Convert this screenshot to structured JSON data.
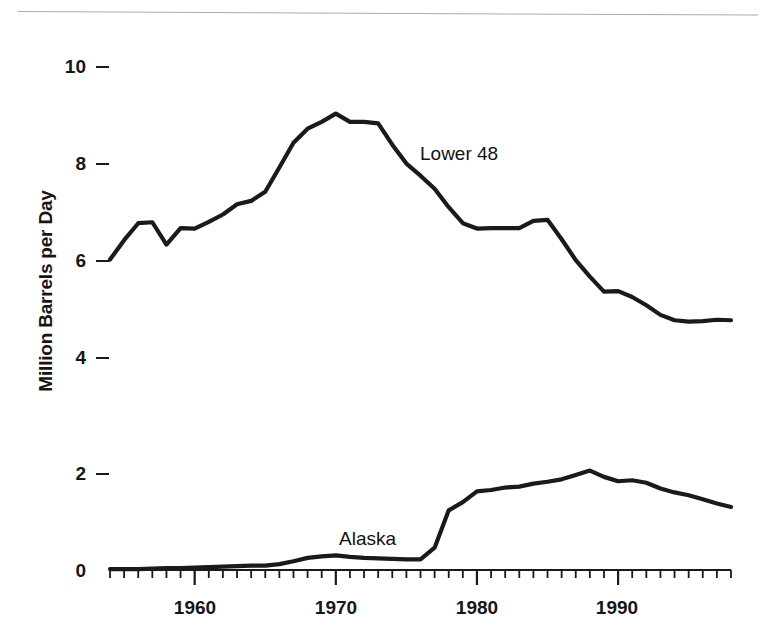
{
  "chart_data": {
    "type": "line",
    "title": "",
    "xlabel": "",
    "ylabel": "Million Barrels per Day",
    "xlim": [
      1954,
      1998
    ],
    "ylim": [
      0,
      10.6
    ],
    "grid": false,
    "legend_position": "inline-annotation",
    "y_ticks": [
      0,
      2,
      4,
      6,
      8,
      10
    ],
    "y_tick_labels": [
      "0",
      "2",
      "4",
      "6",
      "8",
      "10"
    ],
    "x_tick_labels": [
      "1960",
      "1970",
      "1980",
      "1990"
    ],
    "x_tick_values": [
      1960,
      1970,
      1980,
      1990
    ],
    "x_minor_tick_interval": 1,
    "annotations": [
      {
        "text": "Lower 48",
        "x": 1973.5,
        "y": 8.35
      },
      {
        "text": "Alaska",
        "x": 1969.5,
        "y": 0.45
      }
    ],
    "series": [
      {
        "name": "Lower 48",
        "color": "#1a1a1a",
        "x": [
          1954,
          1955,
          1956,
          1957,
          1958,
          1959,
          1960,
          1961,
          1962,
          1963,
          1964,
          1965,
          1966,
          1967,
          1968,
          1969,
          1970,
          1971,
          1972,
          1973,
          1974,
          1975,
          1976,
          1977,
          1978,
          1979,
          1980,
          1981,
          1982,
          1983,
          1984,
          1985,
          1986,
          1987,
          1988,
          1989,
          1990,
          1991,
          1992,
          1993,
          1994,
          1995,
          1996,
          1997,
          1998
        ],
        "values": [
          6.4,
          6.8,
          7.15,
          7.17,
          6.71,
          7.05,
          7.04,
          7.18,
          7.33,
          7.54,
          7.61,
          7.8,
          8.3,
          8.81,
          9.1,
          9.24,
          9.41,
          9.24,
          9.24,
          9.21,
          8.77,
          8.38,
          8.13,
          7.86,
          7.48,
          7.15,
          7.04,
          7.05,
          7.05,
          7.05,
          7.2,
          7.22,
          6.82,
          6.39,
          6.05,
          5.74,
          5.75,
          5.63,
          5.46,
          5.26,
          5.15,
          5.12,
          5.13,
          5.16,
          5.15
        ]
      },
      {
        "name": "Alaska",
        "color": "#1a1a1a",
        "x": [
          1954,
          1955,
          1956,
          1957,
          1958,
          1959,
          1960,
          1961,
          1962,
          1963,
          1964,
          1965,
          1966,
          1967,
          1968,
          1969,
          1970,
          1971,
          1972,
          1973,
          1974,
          1975,
          1976,
          1977,
          1978,
          1979,
          1980,
          1981,
          1982,
          1983,
          1984,
          1985,
          1986,
          1987,
          1988,
          1989,
          1990,
          1991,
          1992,
          1993,
          1994,
          1995,
          1996,
          1997,
          1998
        ],
        "values": [
          0.02,
          0.02,
          0.02,
          0.03,
          0.04,
          0.04,
          0.05,
          0.06,
          0.07,
          0.08,
          0.09,
          0.09,
          0.12,
          0.18,
          0.25,
          0.28,
          0.3,
          0.27,
          0.25,
          0.24,
          0.23,
          0.22,
          0.22,
          0.46,
          1.23,
          1.4,
          1.62,
          1.65,
          1.7,
          1.72,
          1.78,
          1.82,
          1.87,
          1.96,
          2.05,
          1.92,
          1.83,
          1.85,
          1.8,
          1.68,
          1.6,
          1.54,
          1.46,
          1.37,
          1.3
        ]
      }
    ]
  }
}
